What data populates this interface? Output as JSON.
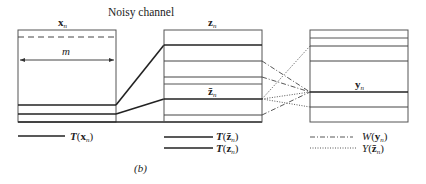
{
  "title": "Noisy channel",
  "figure_label": "(b)",
  "boxes": {
    "input": {
      "label": "x",
      "sub": "n",
      "width_label": "m"
    },
    "channel": {
      "label": "z",
      "sub": "n",
      "inner_label": "z̄",
      "inner_sub": "n"
    },
    "output": {
      "label": "y",
      "sub": "n"
    }
  },
  "legend": {
    "t_x": {
      "fn": "T",
      "arg": "x",
      "sub": "n",
      "style": "solid"
    },
    "t_zbar": {
      "fn": "T",
      "arg": "z̄",
      "sub": "n",
      "style": "solid"
    },
    "t_z": {
      "fn": "T",
      "arg": "z",
      "sub": "n",
      "style": "solid"
    },
    "w_y": {
      "fn": "W",
      "arg": "y",
      "sub": "n",
      "style": "dash-dot"
    },
    "y_zbar": {
      "fn": "Y",
      "arg": "z̄",
      "sub": "n",
      "style": "dotted"
    }
  },
  "colors": {
    "line": "#222222",
    "thin": "#555555",
    "background": "#ffffff"
  }
}
